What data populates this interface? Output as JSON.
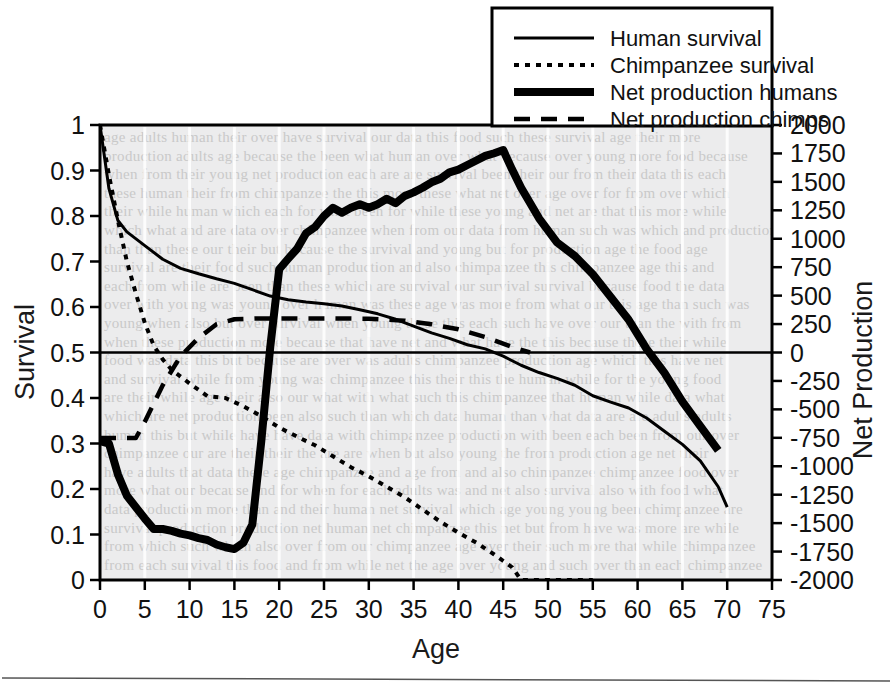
{
  "figure": {
    "name": "survival-and-net-production-chart",
    "background_color": "#ffffff",
    "plot_background_color": "#ececed",
    "line_color": "#000000",
    "ghost_text_color": "#c9c9c9",
    "footer_rule": "horizontal-rule"
  },
  "legend": {
    "position": "top-right",
    "items": [
      {
        "label": "Human survival",
        "style": "solid-thin"
      },
      {
        "label": "Chimpanzee survival",
        "style": "dotted"
      },
      {
        "label": "Net production humans",
        "style": "solid-thick"
      },
      {
        "label": "Net production chimps",
        "style": "dashed"
      }
    ]
  },
  "chart_data": {
    "type": "line",
    "title": "",
    "xlabel": "Age",
    "ylabel": "Survival",
    "y2label": "Net Production",
    "xlim": [
      0,
      75
    ],
    "ylim": [
      0,
      1
    ],
    "y2lim": [
      -2000,
      2000
    ],
    "grid": "faint-vertical",
    "xticks": [
      0,
      5,
      10,
      15,
      20,
      25,
      30,
      35,
      40,
      45,
      50,
      55,
      60,
      65,
      70,
      75
    ],
    "yticks": [
      "0",
      "0.1",
      "0.2",
      "0.3",
      "0.4",
      "0.5",
      "0.6",
      "0.7",
      "0.8",
      "0.9",
      "1"
    ],
    "y2ticks": [
      "-2000",
      "-1750",
      "-1500",
      "-1250",
      "-1000",
      "-750",
      "-500",
      "-250",
      "0",
      "250",
      "500",
      "750",
      "1000",
      "1250",
      "1500",
      "1750",
      "2000"
    ],
    "reference_lines": [
      {
        "axis": "y",
        "value": 0.5,
        "label": "net-production-zero"
      }
    ],
    "series": [
      {
        "name": "Human survival",
        "axis": "left",
        "style": "solid-thin",
        "x": [
          0,
          1,
          2,
          3,
          5,
          7,
          9,
          11,
          13,
          15,
          17,
          19,
          21,
          23,
          25,
          27,
          29,
          31,
          33,
          35,
          37,
          39,
          41,
          43,
          45,
          47,
          49,
          51,
          53,
          55,
          57,
          59,
          61,
          63,
          65,
          67,
          69,
          70
        ],
        "y": [
          1.0,
          0.86,
          0.79,
          0.765,
          0.735,
          0.705,
          0.685,
          0.673,
          0.662,
          0.652,
          0.638,
          0.624,
          0.616,
          0.611,
          0.607,
          0.602,
          0.594,
          0.585,
          0.573,
          0.558,
          0.543,
          0.531,
          0.517,
          0.508,
          0.492,
          0.472,
          0.456,
          0.443,
          0.428,
          0.405,
          0.391,
          0.378,
          0.356,
          0.327,
          0.298,
          0.262,
          0.205,
          0.16
        ]
      },
      {
        "name": "Chimpanzee survival",
        "axis": "left",
        "style": "dotted",
        "x": [
          0,
          1,
          2,
          3,
          4,
          5,
          6,
          7,
          8,
          10,
          12,
          14,
          16,
          18,
          20,
          22,
          24,
          26,
          28,
          30,
          32,
          34,
          36,
          38,
          40,
          42,
          44,
          46,
          47,
          49,
          51,
          53,
          55
        ],
        "y": [
          1.0,
          0.89,
          0.79,
          0.7,
          0.63,
          0.565,
          0.515,
          0.485,
          0.462,
          0.432,
          0.404,
          0.4,
          0.382,
          0.36,
          0.335,
          0.315,
          0.296,
          0.272,
          0.248,
          0.228,
          0.205,
          0.182,
          0.155,
          0.128,
          0.104,
          0.082,
          0.056,
          0.028,
          0.0,
          0.0,
          0.0,
          0.0,
          0.0
        ]
      },
      {
        "name": "Net production humans",
        "axis": "right",
        "style": "solid-thick",
        "x": [
          0,
          1,
          2,
          3,
          5,
          6,
          7,
          8,
          9,
          10,
          11,
          12,
          13,
          14,
          15,
          16,
          17,
          18,
          19,
          20,
          21,
          22,
          23,
          24,
          25,
          26,
          27,
          28,
          29,
          30,
          31,
          32,
          33,
          34,
          35,
          36,
          37,
          38,
          39,
          40,
          41,
          42,
          43,
          44,
          45,
          46,
          47,
          49,
          51,
          53,
          55,
          57,
          59,
          61,
          63,
          65,
          67,
          69
        ],
        "y": [
          0.305,
          0.3,
          0.232,
          0.185,
          0.135,
          0.112,
          0.112,
          0.108,
          0.102,
          0.098,
          0.092,
          0.088,
          0.078,
          0.072,
          0.068,
          0.082,
          0.122,
          0.305,
          0.512,
          0.683,
          0.706,
          0.728,
          0.762,
          0.776,
          0.8,
          0.818,
          0.807,
          0.818,
          0.826,
          0.818,
          0.826,
          0.838,
          0.828,
          0.844,
          0.852,
          0.862,
          0.874,
          0.882,
          0.896,
          0.902,
          0.912,
          0.922,
          0.932,
          0.938,
          0.945,
          0.902,
          0.862,
          0.795,
          0.742,
          0.712,
          0.672,
          0.622,
          0.572,
          0.508,
          0.455,
          0.392,
          0.338,
          0.285
        ]
      },
      {
        "name": "Net production chimps",
        "axis": "right",
        "style": "dashed",
        "x": [
          0,
          4,
          5,
          7,
          9,
          11,
          13,
          15,
          18,
          22,
          26,
          30,
          34,
          37,
          40,
          43,
          46,
          48
        ],
        "y": [
          0.312,
          0.312,
          0.348,
          0.428,
          0.492,
          0.532,
          0.562,
          0.573,
          0.575,
          0.575,
          0.575,
          0.574,
          0.57,
          0.562,
          0.551,
          0.534,
          0.512,
          0.5
        ]
      }
    ]
  }
}
